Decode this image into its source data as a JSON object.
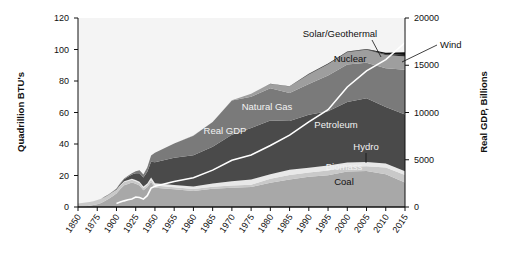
{
  "chart_data": {
    "type": "area",
    "title": "",
    "xlabel": "",
    "ylabel": "Quadrillion BTU's",
    "y2label": "Real GDP, Billions",
    "xtick_labels": [
      "1850",
      "1875",
      "1900",
      "1925",
      "1950",
      "1955",
      "1960",
      "1965",
      "1970",
      "1975",
      "1980",
      "1985",
      "1990",
      "1995",
      "2000",
      "2005",
      "2010",
      "2015"
    ],
    "ytick_labels": [
      "0",
      "20",
      "40",
      "60",
      "80",
      "100",
      "120"
    ],
    "ylim": [
      0,
      120
    ],
    "y2tick_labels": [
      "0",
      "5000",
      "10000",
      "15000",
      "20000"
    ],
    "y2lim": [
      0,
      20000
    ],
    "grid": false,
    "legend_position": "inline-annotations",
    "stack_order_bottom_to_top": [
      "Coal",
      "Biomass",
      "Hydro",
      "Petroleum",
      "Natural Gas",
      "Nuclear",
      "Solar/Geothermal",
      "Wind"
    ],
    "annotations": [
      {
        "text": "Coal",
        "style": "dark"
      },
      {
        "text": "Biomass",
        "style": "light"
      },
      {
        "text": "Hydro",
        "style": "light",
        "leader": true
      },
      {
        "text": "Petroleum",
        "style": "light"
      },
      {
        "text": "Natural Gas",
        "style": "light"
      },
      {
        "text": "Real GDP",
        "style": "light"
      },
      {
        "text": "Nuclear",
        "style": "dark"
      },
      {
        "text": "Solar/Geothermal",
        "style": "dark",
        "leader": true
      },
      {
        "text": "Wind",
        "style": "dark",
        "leader": true
      }
    ],
    "x": [
      1850,
      1855,
      1860,
      1865,
      1870,
      1875,
      1880,
      1885,
      1890,
      1895,
      1900,
      1905,
      1910,
      1915,
      1920,
      1925,
      1930,
      1935,
      1940,
      1945,
      1950,
      1955,
      1960,
      1965,
      1970,
      1975,
      1980,
      1985,
      1990,
      1995,
      2000,
      2005,
      2010,
      2015,
      2018
    ],
    "series": [
      {
        "name": "Coal",
        "color": "#a8a8a8",
        "values": [
          0.2,
          0.3,
          0.5,
          0.8,
          1.2,
          1.8,
          2.6,
          3.8,
          5.2,
          6.8,
          8.6,
          11.5,
          13.8,
          14.6,
          15.5,
          14.7,
          13.6,
          10.6,
          12.5,
          15.9,
          12.3,
          11.2,
          10.1,
          11.6,
          12.3,
          12.7,
          15.4,
          17.5,
          19.2,
          20.1,
          22.6,
          22.8,
          20.8,
          15.6,
          13.2
        ]
      },
      {
        "name": "Biomass",
        "color": "#c9c9c9",
        "values": [
          2.1,
          2.2,
          2.3,
          2.4,
          2.5,
          2.6,
          2.6,
          2.6,
          2.5,
          2.4,
          2.2,
          2.1,
          2.0,
          1.9,
          1.8,
          1.7,
          1.6,
          1.5,
          1.5,
          1.4,
          1.4,
          1.4,
          1.3,
          1.3,
          1.4,
          1.5,
          2.5,
          2.8,
          2.7,
          3.1,
          2.9,
          3.1,
          4.3,
          4.7,
          5.1
        ]
      },
      {
        "name": "Hydro",
        "color": "#e8e8e8",
        "values": [
          0.0,
          0.0,
          0.0,
          0.0,
          0.0,
          0.0,
          0.0,
          0.0,
          0.0,
          0.1,
          0.2,
          0.3,
          0.5,
          0.6,
          0.7,
          0.8,
          0.8,
          0.9,
          0.9,
          1.4,
          1.4,
          1.4,
          1.6,
          2.1,
          2.6,
          3.2,
          2.9,
          3.4,
          3.0,
          3.2,
          2.8,
          2.7,
          2.5,
          2.4,
          2.7
        ]
      },
      {
        "name": "Petroleum",
        "color": "#4a4a4a",
        "values": [
          0.0,
          0.0,
          0.0,
          0.0,
          0.0,
          0.1,
          0.1,
          0.2,
          0.2,
          0.3,
          0.5,
          0.9,
          1.3,
          2.1,
          2.6,
          4.3,
          5.4,
          5.7,
          7.5,
          10.1,
          13.3,
          17.3,
          19.9,
          23.2,
          29.5,
          32.7,
          34.2,
          30.9,
          33.6,
          34.4,
          38.3,
          40.4,
          35.9,
          36.1,
          36.9
        ]
      },
      {
        "name": "Natural Gas",
        "color": "#7a7a7a",
        "values": [
          0.0,
          0.0,
          0.0,
          0.0,
          0.0,
          0.0,
          0.0,
          0.1,
          0.2,
          0.2,
          0.3,
          0.4,
          0.5,
          0.7,
          0.8,
          1.2,
          2.0,
          1.9,
          2.7,
          3.9,
          6.0,
          9.0,
          12.4,
          15.8,
          21.8,
          19.9,
          20.4,
          17.8,
          19.6,
          22.7,
          23.8,
          22.6,
          24.6,
          28.4,
          31.0
        ]
      },
      {
        "name": "Nuclear",
        "color": "#9e9e9e",
        "values": [
          0,
          0,
          0,
          0,
          0,
          0,
          0,
          0,
          0,
          0,
          0,
          0,
          0,
          0,
          0,
          0,
          0,
          0,
          0,
          0,
          0,
          0,
          0.04,
          0.04,
          0.24,
          1.9,
          2.7,
          4.1,
          6.1,
          7.2,
          7.9,
          8.2,
          8.4,
          8.4,
          8.4
        ]
      },
      {
        "name": "Solar/Geothermal",
        "color": "#2b2b2b",
        "values": [
          0,
          0,
          0,
          0,
          0,
          0,
          0,
          0,
          0,
          0,
          0,
          0,
          0,
          0,
          0,
          0,
          0,
          0,
          0,
          0,
          0,
          0,
          0,
          0,
          0.01,
          0.07,
          0.11,
          0.2,
          0.3,
          0.35,
          0.35,
          0.4,
          0.5,
          0.9,
          1.3
        ]
      },
      {
        "name": "Wind",
        "color": "#111111",
        "values": [
          0,
          0,
          0,
          0,
          0,
          0,
          0,
          0,
          0,
          0,
          0,
          0,
          0,
          0,
          0,
          0,
          0,
          0,
          0,
          0,
          0,
          0,
          0,
          0,
          0,
          0,
          0,
          0,
          0.03,
          0.03,
          0.06,
          0.18,
          0.92,
          1.8,
          2.5
        ]
      }
    ],
    "gdp_line": {
      "name": "Real GDP",
      "color": "#ffffff",
      "unit": "Billions",
      "values": [
        null,
        null,
        null,
        null,
        null,
        null,
        null,
        null,
        null,
        null,
        380,
        520,
        650,
        760,
        840,
        1050,
        1000,
        830,
        1200,
        2000,
        2200,
        2700,
        3100,
        3900,
        4950,
        5500,
        6500,
        7600,
        9000,
        10300,
        12700,
        14400,
        15600,
        17400,
        18600
      ]
    },
    "plot_bg": "#f4f4f4",
    "axis_color": "#111111"
  }
}
